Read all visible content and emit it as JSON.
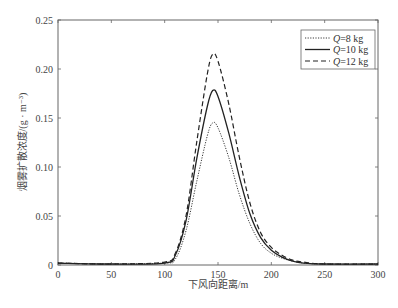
{
  "chart_data": {
    "type": "line",
    "title": "",
    "xlabel": "下风向距离/m",
    "ylabel": "烟雾扩散浓度/(g · m⁻³)",
    "xlim": [
      0,
      300
    ],
    "ylim": [
      0,
      0.25
    ],
    "xticks": [
      "0",
      "50",
      "100",
      "150",
      "200",
      "250",
      "300"
    ],
    "yticks": [
      "0",
      "0.05",
      "0.10",
      "0.15",
      "0.20",
      "0.25"
    ],
    "grid": false,
    "legend_position": "upper right",
    "x": [
      0,
      50,
      100,
      110,
      120,
      130,
      140,
      145,
      150,
      160,
      170,
      180,
      190,
      200,
      210,
      220,
      230,
      250,
      300
    ],
    "series": [
      {
        "name": "Q=8 kg",
        "style": "dotted",
        "values": [
          0.002,
          0.001,
          0.002,
          0.006,
          0.035,
          0.085,
          0.132,
          0.145,
          0.14,
          0.11,
          0.072,
          0.042,
          0.022,
          0.012,
          0.007,
          0.004,
          0.002,
          0.001,
          0.001
        ]
      },
      {
        "name": "Q=10 kg",
        "style": "solid",
        "values": [
          0.002,
          0.001,
          0.002,
          0.01,
          0.045,
          0.108,
          0.162,
          0.178,
          0.172,
          0.135,
          0.09,
          0.052,
          0.028,
          0.015,
          0.008,
          0.004,
          0.002,
          0.001,
          0.001
        ]
      },
      {
        "name": "Q=12 kg",
        "style": "dashed",
        "values": [
          0.002,
          0.001,
          0.003,
          0.012,
          0.05,
          0.125,
          0.195,
          0.215,
          0.208,
          0.165,
          0.11,
          0.063,
          0.033,
          0.018,
          0.01,
          0.005,
          0.003,
          0.001,
          0.001
        ]
      }
    ],
    "legend": [
      {
        "label_var": "Q",
        "label_rest": "=8 kg",
        "style": "dotted"
      },
      {
        "label_var": "Q",
        "label_rest": "=10 kg",
        "style": "solid"
      },
      {
        "label_var": "Q",
        "label_rest": "=12 kg",
        "style": "dashed"
      }
    ]
  },
  "colors": {
    "line": "#222222",
    "axis": "#555555"
  }
}
